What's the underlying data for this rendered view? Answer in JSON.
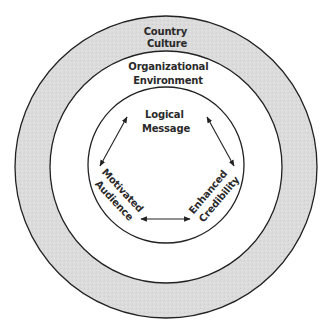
{
  "diagram": {
    "type": "concentric-circles",
    "colors": {
      "outer_ring_fill": "#dcdcdc",
      "inner_fill": "#ffffff",
      "stroke": "#222222",
      "text": "#2a2a2a"
    },
    "rings": [
      {
        "id": "outer",
        "label_lines": [
          "Country",
          "Culture"
        ]
      },
      {
        "id": "middle",
        "label_lines": [
          "Organizational",
          "Environment"
        ]
      }
    ],
    "nodes": [
      {
        "id": "logical-message",
        "label_lines": [
          "Logical",
          "Message"
        ]
      },
      {
        "id": "motivated-audience",
        "label_lines": [
          "Motivated",
          "Audience"
        ]
      },
      {
        "id": "enhanced-credibility",
        "label_lines": [
          "Enhanced",
          "Credibility"
        ]
      }
    ],
    "connections": [
      {
        "from": "logical-message",
        "to": "motivated-audience",
        "type": "bidirectional"
      },
      {
        "from": "logical-message",
        "to": "enhanced-credibility",
        "type": "bidirectional"
      },
      {
        "from": "motivated-audience",
        "to": "enhanced-credibility",
        "type": "bidirectional"
      }
    ]
  }
}
